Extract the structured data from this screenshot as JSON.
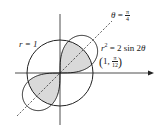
{
  "diagram": {
    "type": "polar-curves",
    "origin_px": [
      60,
      73
    ],
    "unit_px": 33,
    "curves": [
      {
        "name": "circle",
        "equation": "r = 1",
        "label": "r = 1"
      },
      {
        "name": "lemniscate",
        "equation": "r^2 = 2 sin 2θ",
        "label": "r² = 2 sin 2θ"
      }
    ],
    "line": {
      "equation": "θ = π/4",
      "style": "dashed"
    },
    "point": {
      "label": "(1, π/12)",
      "r": 1,
      "theta": "π/12"
    },
    "shaded_region": "inside lemniscate and inside circle",
    "colors": {
      "stroke": "#222222",
      "fill": "#d9d9d9",
      "background": "#ffffff"
    }
  },
  "labels": {
    "theta_lhs": "θ",
    "theta_eq": " = ",
    "theta_num": "π",
    "theta_den": "4",
    "r_eq_1": "r = 1",
    "lem_r": "r",
    "lem_sup": "2",
    "lem_rest": " = 2 sin 2",
    "lem_theta": "θ",
    "pt_open": "(",
    "pt_one": "1, ",
    "pt_num": "π",
    "pt_den": "12",
    "pt_close": ")"
  }
}
